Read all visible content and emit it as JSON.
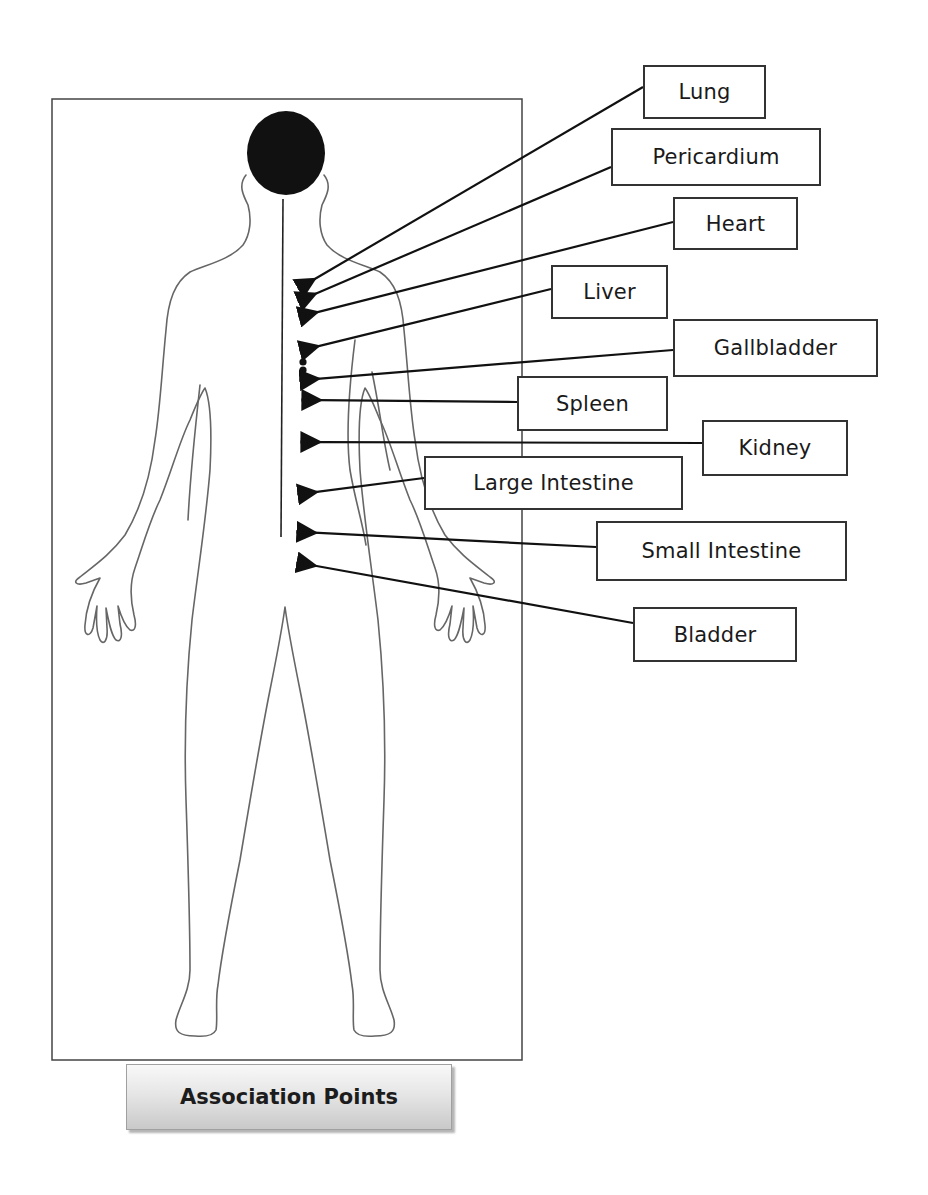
{
  "diagram": {
    "title": "Association Points",
    "colors": {
      "outline": "#555555",
      "ink": "#111111",
      "frame": "#444444"
    },
    "labels": [
      {
        "id": "lung",
        "text": "Lung",
        "box": [
          643,
          65,
          123,
          54
        ],
        "point": [
          301,
          287
        ],
        "arrow_from": [
          643,
          87
        ]
      },
      {
        "id": "pericardium",
        "text": "Pericardium",
        "box": [
          611,
          128,
          210,
          58
        ],
        "point": [
          301,
          300
        ],
        "arrow_from": [
          611,
          167
        ]
      },
      {
        "id": "heart",
        "text": "Heart",
        "box": [
          673,
          197,
          125,
          53
        ],
        "point": [
          302,
          316
        ],
        "arrow_from": [
          673,
          222
        ]
      },
      {
        "id": "liver",
        "text": "Liver",
        "box": [
          551,
          265,
          117,
          54
        ],
        "point": [
          303,
          350
        ],
        "arrow_from": [
          551,
          289
        ]
      },
      {
        "id": "gallbladder",
        "text": "Gallbladder",
        "box": [
          673,
          319,
          205,
          58
        ],
        "point": [
          303,
          380
        ],
        "arrow_from": [
          673,
          350
        ]
      },
      {
        "id": "spleen",
        "text": "Spleen",
        "box": [
          517,
          376,
          151,
          55
        ],
        "point": [
          305,
          400
        ],
        "arrow_from": [
          517,
          402
        ]
      },
      {
        "id": "kidney",
        "text": "Kidney",
        "box": [
          702,
          420,
          146,
          56
        ],
        "point": [
          304,
          442
        ],
        "arrow_from": [
          702,
          443
        ]
      },
      {
        "id": "large_intestine",
        "text": "Large Intestine",
        "box": [
          424,
          456,
          259,
          54
        ],
        "point": [
          301,
          494
        ],
        "arrow_from": [
          424,
          478
        ]
      },
      {
        "id": "small_intestine",
        "text": "Small Intestine",
        "box": [
          596,
          521,
          251,
          60
        ],
        "point": [
          300,
          532
        ],
        "arrow_from": [
          596,
          547
        ]
      },
      {
        "id": "bladder",
        "text": "Bladder",
        "box": [
          633,
          607,
          164,
          55
        ],
        "point": [
          300,
          563
        ],
        "arrow_from": [
          633,
          623
        ]
      }
    ],
    "extra_points": [
      [
        303,
        362
      ],
      [
        303,
        370
      ]
    ]
  }
}
